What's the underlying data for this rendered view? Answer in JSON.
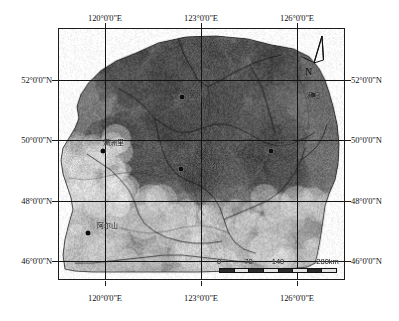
{
  "figure": {
    "type": "thematic-raster-map",
    "region": "Northeast China (Heilongjiang / Inner Mongolia border area)",
    "background_color": "#ffffff",
    "frame_color": "#1c1c1c"
  },
  "graticule": {
    "longitude_labels": [
      "120°0'0\"E",
      "123°0'0\"E",
      "126°0'0\"E"
    ],
    "latitude_labels": [
      "52°0'0\"N",
      "50°0'0\"N",
      "48°0'0\"N",
      "46°0'0\"N"
    ],
    "longitude_values": [
      120,
      123,
      126
    ],
    "latitude_values": [
      52,
      50,
      48,
      46
    ],
    "line_color": "#141414"
  },
  "cities": [
    {
      "name": "漠河",
      "lon_pct": 43.0,
      "lat_pct": 27.0,
      "label_dx": 14,
      "label_dy": -4,
      "size": "big"
    },
    {
      "name": "满洲里",
      "lon_pct": 15.5,
      "lat_pct": 48.5,
      "label_dx": 10,
      "label_dy": -9,
      "size": "small"
    },
    {
      "name": "齐齐哈尔",
      "lon_pct": 42.5,
      "lat_pct": 55.5,
      "label_dx": 22,
      "label_dy": -4,
      "size": "big"
    },
    {
      "name": "黑河",
      "lon_pct": 74.0,
      "lat_pct": 48.5,
      "label_dx": 14,
      "label_dy": -8,
      "size": "small"
    },
    {
      "name": "满归",
      "lon_pct": 88.5,
      "lat_pct": 26.0,
      "label_dx": 0,
      "label_dy": 0,
      "size": "small"
    },
    {
      "name": "阿尔山",
      "lon_pct": 10.0,
      "lat_pct": 81.0,
      "label_dx": 20,
      "label_dy": -8,
      "size": "small"
    }
  ],
  "north_arrow": {
    "label": "N",
    "icon": "north-arrow-icon"
  },
  "scalebar": {
    "unit_suffix": "km",
    "tick_labels": [
      "0",
      "70",
      "140",
      "280km"
    ],
    "tick_positions_pct": [
      0,
      25,
      50,
      100
    ],
    "segments": 8,
    "max_value": 280
  },
  "chart_data": {
    "type": "map",
    "title": "",
    "projection": "geographic",
    "xlabel": "Longitude",
    "ylabel": "Latitude",
    "xlim": [
      118.2,
      128.4
    ],
    "ylim": [
      45.3,
      53.6
    ],
    "xticks": [
      120,
      123,
      126
    ],
    "yticks": [
      46,
      48,
      50,
      52
    ],
    "xtick_labels": [
      "120°0'0\"E",
      "123°0'0\"E",
      "126°0'0\"E"
    ],
    "ytick_labels": [
      "46°0'0\"N",
      "48°0'0\"N",
      "50°0'0\"N",
      "52°0'0\"N"
    ],
    "grid": true,
    "legend": "none",
    "basemap": "grayscale raster imagery",
    "annotations": [
      "north arrow",
      "scale bar 0-280 km"
    ]
  }
}
